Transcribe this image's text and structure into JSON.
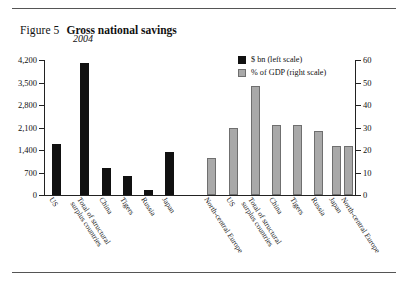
{
  "figure": {
    "label": "Figure 5",
    "title": "Gross national savings",
    "subtitle": "2004"
  },
  "legend": {
    "items": [
      {
        "key": "usd_bn",
        "label": "$ bn (left scale)",
        "color": "#111111",
        "swatch": "black"
      },
      {
        "key": "pct_gdp",
        "label": "% of GDP (right scale)",
        "color": "#a9a9a9",
        "swatch": "gray"
      }
    ]
  },
  "axes": {
    "left_ticks": [
      "4,200",
      "3,500",
      "2,800",
      "2,100",
      "1,400",
      "700",
      "0"
    ],
    "right_ticks": [
      "60",
      "50",
      "40",
      "30",
      "20",
      "10",
      "0"
    ]
  },
  "chart_data": {
    "type": "bar",
    "title": "Gross national savings",
    "subtitle": "2004",
    "xlabel": "",
    "ylabel": "",
    "grid": false,
    "legend_position": "top-right",
    "categories": [
      "US",
      "Total of structural surplus countries",
      "China",
      "Tigers",
      "Russia",
      "Japan",
      "North-central Europe"
    ],
    "series": [
      {
        "name": "$ bn (left scale)",
        "axis": "left",
        "unit": "$ bn",
        "color": "#111111",
        "ylim": [
          0,
          4200
        ],
        "values": [
          1600,
          4100,
          850,
          600,
          170,
          1350,
          1150
        ]
      },
      {
        "name": "% of GDP (right scale)",
        "axis": "right",
        "unit": "% of GDP",
        "color": "#a9a9a9",
        "ylim": [
          0,
          60
        ],
        "values": [
          30,
          48.5,
          31,
          31,
          28.5,
          22,
          22
        ]
      }
    ],
    "bars": [
      {
        "group": "usd_bn",
        "category": "US",
        "value": 1600,
        "axis": "left",
        "color": "black"
      },
      {
        "group": "usd_bn",
        "category": "Total of structural surplus countries",
        "value": 4100,
        "axis": "left",
        "color": "black"
      },
      {
        "group": "usd_bn",
        "category": "China",
        "value": 850,
        "axis": "left",
        "color": "black"
      },
      {
        "group": "usd_bn",
        "category": "Tigers",
        "value": 600,
        "axis": "left",
        "color": "black"
      },
      {
        "group": "usd_bn",
        "category": "Russia",
        "value": 170,
        "axis": "left",
        "color": "black"
      },
      {
        "group": "usd_bn",
        "category": "Japan",
        "value": 1350,
        "axis": "left",
        "color": "black"
      },
      {
        "group": "usd_bn",
        "category": "North-central Europe",
        "value": 1150,
        "axis": "left",
        "color": "gray"
      },
      {
        "group": "pct_gdp",
        "category": "US",
        "value": 30,
        "axis": "right",
        "color": "gray"
      },
      {
        "group": "pct_gdp",
        "category": "Total of structural surplus countries",
        "value": 48.5,
        "axis": "right",
        "color": "gray"
      },
      {
        "group": "pct_gdp",
        "category": "China",
        "value": 31,
        "axis": "right",
        "color": "gray"
      },
      {
        "group": "pct_gdp",
        "category": "Tigers",
        "value": 31,
        "axis": "right",
        "color": "gray"
      },
      {
        "group": "pct_gdp",
        "category": "Russia",
        "value": 28.5,
        "axis": "right",
        "color": "gray"
      },
      {
        "group": "pct_gdp",
        "category": "Japan",
        "value": 22,
        "axis": "right",
        "color": "gray"
      },
      {
        "group": "pct_gdp",
        "category": "North-central Europe",
        "value": 22,
        "axis": "right",
        "color": "gray"
      }
    ],
    "x_tick_labels": [
      "US",
      "Total of structural\nsurplus countries",
      "China",
      "Tigers",
      "Russia",
      "Japan",
      "North-central Europe",
      "US",
      "Total of structural\nsurplus countries",
      "China",
      "Tigers",
      "Russia",
      "Japan",
      "North-central Europe"
    ]
  }
}
